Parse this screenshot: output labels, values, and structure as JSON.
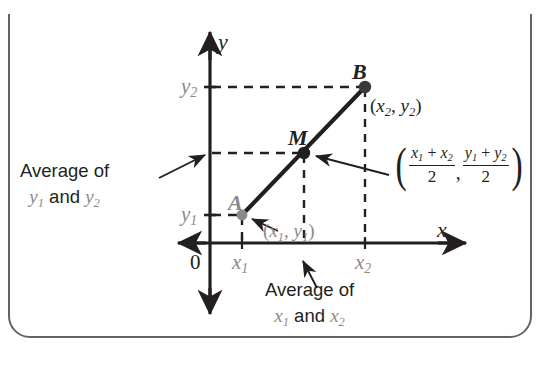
{
  "figure": {
    "type": "coordinate-geometry-diagram",
    "background_color": "#ffffff",
    "frame": {
      "border_color": "#636363",
      "rounded": true
    },
    "colors": {
      "axis": "#231f20",
      "segment": "#231f20",
      "dashed_guide": "#231f20",
      "gray_label": "#8a8a8a",
      "black_label": "#231f20",
      "point_A": "#8a8a8a",
      "point_M": "#231f20",
      "point_B": "#3a3a3a"
    }
  },
  "axes": {
    "y_axis_label": "y",
    "x_axis_label": "x",
    "origin_label": "0",
    "y_ticks": [
      {
        "id": "y2",
        "base": "y",
        "sub": "2"
      },
      {
        "id": "y1",
        "base": "y",
        "sub": "1"
      }
    ],
    "x_ticks": [
      {
        "id": "x1",
        "base": "x",
        "sub": "1"
      },
      {
        "id": "x2",
        "base": "x",
        "sub": "2"
      }
    ]
  },
  "points": {
    "A": {
      "letter": "A",
      "coord_open": "(",
      "coord_x_base": "x",
      "coord_x_sub": "1",
      "coord_sep": ", ",
      "coord_y_base": "y",
      "coord_y_sub": "1",
      "coord_close": ")"
    },
    "M": {
      "letter": "M"
    },
    "B": {
      "letter": "B",
      "coord_open": "(",
      "coord_x_base": "x",
      "coord_x_sub": "2",
      "coord_sep": ", ",
      "coord_y_base": "y",
      "coord_y_sub": "2",
      "coord_close": ")"
    }
  },
  "annotations": {
    "y_average": {
      "line1": "Average of",
      "line2_prefix": "y",
      "line2_sub1": "1",
      "line2_mid": " and ",
      "line2_base2": "y",
      "line2_sub2": "2"
    },
    "x_average": {
      "line1": "Average of",
      "line2_prefix": "x",
      "line2_sub1": "1",
      "line2_mid": " and ",
      "line2_base2": "x",
      "line2_sub2": "2"
    }
  },
  "midpoint_formula": {
    "open_paren": "(",
    "x_numerator_a": "x",
    "x_numerator_a_sub": "1",
    "x_plus": " + ",
    "x_numerator_b": "x",
    "x_numerator_b_sub": "2",
    "x_denominator": "2",
    "comma": ",",
    "y_numerator_a": "y",
    "y_numerator_a_sub": "1",
    "y_plus": " + ",
    "y_numerator_b": "y",
    "y_numerator_b_sub": "2",
    "y_denominator": "2",
    "close_paren": ")"
  }
}
